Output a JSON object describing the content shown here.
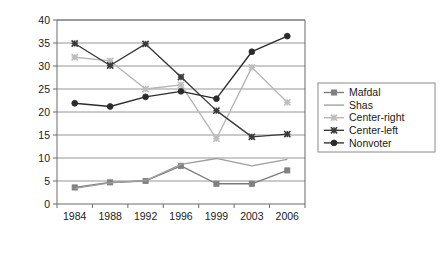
{
  "chart_data": {
    "type": "line",
    "title": "",
    "subtitle": "",
    "xlabel": "",
    "ylabel": "",
    "categories": [
      "1984",
      "1988",
      "1992",
      "1996",
      "1999",
      "2003",
      "2006"
    ],
    "x": [
      1984,
      1988,
      1992,
      1996,
      1999,
      2003,
      2006
    ],
    "ylim": [
      0,
      40
    ],
    "ytick_labels": [
      "0",
      "5",
      "10",
      "15",
      "20",
      "25",
      "30",
      "35",
      "40"
    ],
    "yticks": [
      0,
      5,
      10,
      15,
      20,
      25,
      30,
      35,
      40
    ],
    "grid": "horizontal",
    "legend_position": "right",
    "series": [
      {
        "name": "Mafdal",
        "marker": "square",
        "color": "#808080",
        "line_color": "#7a7a7a",
        "values": [
          3.6,
          4.7,
          5.0,
          8.3,
          4.4,
          4.4,
          7.3
        ]
      },
      {
        "name": "Shas",
        "marker": "none",
        "color": "#a8a8a8",
        "line_color": "#9e9e9e",
        "values": [
          3.4,
          4.6,
          5.1,
          8.6,
          9.9,
          8.3,
          9.7
        ]
      },
      {
        "name": "Center-right",
        "marker": "x",
        "color": "#bdbdbd",
        "line_color": "#b5b5b5",
        "values": [
          31.9,
          31.1,
          25.0,
          25.9,
          14.2,
          29.7,
          22.1
        ]
      },
      {
        "name": "Center-left",
        "marker": "x",
        "color": "#3a3a3a",
        "line_color": "#3a3a3a",
        "values": [
          34.9,
          30.1,
          34.8,
          27.6,
          20.3,
          14.6,
          15.2
        ]
      },
      {
        "name": "Nonvoter",
        "marker": "circle",
        "color": "#2b2b2b",
        "line_color": "#2b2b2b",
        "values": [
          21.9,
          21.2,
          23.3,
          24.5,
          22.9,
          33.1,
          36.5
        ]
      }
    ],
    "axis_color": "#6b6b6b",
    "grid_color": "#8a8a8a",
    "plot_background": "#ffffff",
    "legend_border_color": "#8a8a8a"
  }
}
